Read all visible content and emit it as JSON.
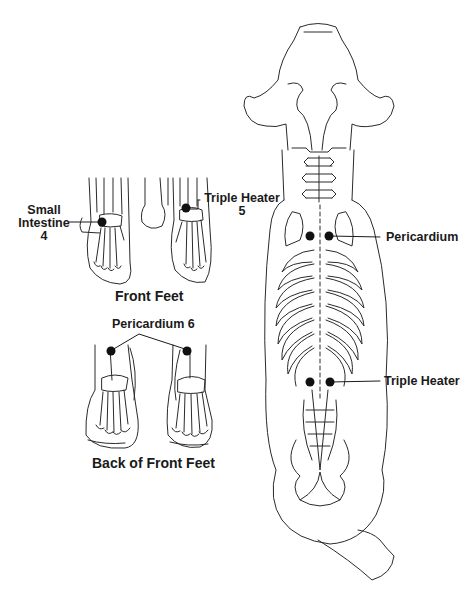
{
  "diagram": {
    "type": "anatomical acupuncture point chart (canine skeleton, dorsal view)",
    "colors": {
      "line": "#2a2a2a",
      "point": "#111111",
      "background": "#ffffff"
    }
  },
  "front_feet": {
    "caption": "Front Feet",
    "labels": {
      "small_intestine": {
        "line1": "Small",
        "line2": "Intestine",
        "line3": "4"
      },
      "triple_heater": {
        "line1": "Triple Heater",
        "line2": "5"
      }
    }
  },
  "back_feet": {
    "caption": "Back of Front Feet",
    "labels": {
      "pericardium": "Pericardium 6"
    }
  },
  "body": {
    "labels": {
      "pericardium": "Pericardium",
      "triple_heater": "Triple Heater"
    }
  }
}
